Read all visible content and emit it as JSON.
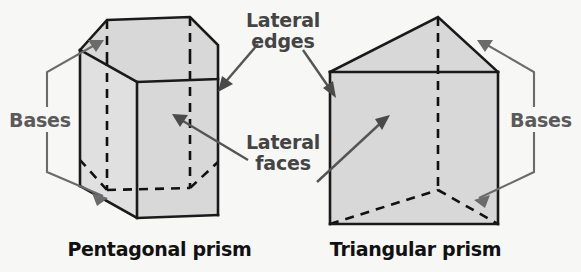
{
  "figure": {
    "background_color": "#f7f7f5",
    "face_fill_color": "#d8d8d8",
    "edge_color": "#1a1a1a",
    "leader_color": "#6b6b6b",
    "label_color": "#5a5a5a",
    "caption_color": "#111111"
  },
  "callouts": {
    "lateral_edges_line1": "Lateral",
    "lateral_edges_line2": "edges",
    "lateral_faces_line1": "Lateral",
    "lateral_faces_line2": "faces",
    "bases_left": "Bases",
    "bases_right": "Bases"
  },
  "solids": [
    {
      "name": "pentagonal-prism",
      "caption": "Pentagonal prism",
      "base_shape": "pentagon",
      "base_count": 2,
      "lateral_face_count": 5,
      "lateral_edge_count": 5
    },
    {
      "name": "triangular-prism",
      "caption": "Triangular prism",
      "base_shape": "triangle",
      "base_count": 2,
      "lateral_face_count": 3,
      "lateral_edge_count": 3
    }
  ],
  "captions": {
    "left": "Pentagonal prism",
    "right": "Triangular prism"
  }
}
